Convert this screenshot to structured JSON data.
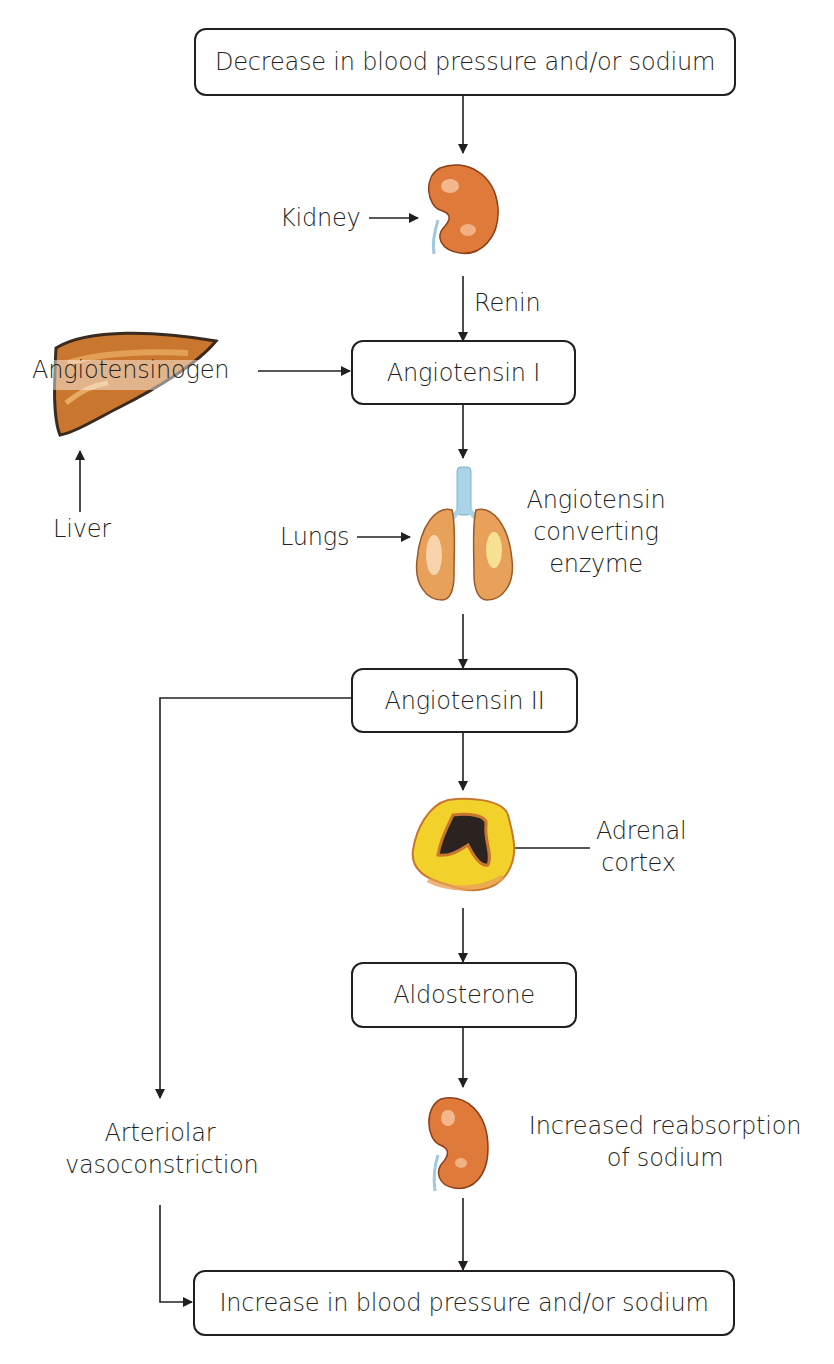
{
  "diagram": {
    "boxes": {
      "start": "Decrease in blood pressure and/or sodium",
      "angiotensin_1": "Angiotensin I",
      "angiotensin_2": "Angiotensin II",
      "aldosterone": "Aldosterone",
      "end": "Increase in blood pressure and/or sodium"
    },
    "labels": {
      "kidney": "Kidney",
      "renin": "Renin",
      "angiotensinogen": "Angiotensinogen",
      "liver": "Liver",
      "lungs": "Lungs",
      "ace_line1": "Angiotensin",
      "ace_line2": "converting",
      "ace_line3": "enzyme",
      "adrenal_line1": "Adrenal",
      "adrenal_line2": "cortex",
      "arteriolar_line1": "Arteriolar",
      "arteriolar_line2": "vasoconstriction",
      "reabsorption_line1": "Increased reabsorption",
      "reabsorption_line2": "of sodium"
    },
    "organs": [
      "kidney-icon",
      "liver-icon",
      "lungs-icon",
      "adrenal-gland-icon",
      "kidney-icon"
    ],
    "colors": {
      "line": "#231f20",
      "kidney": "#e07a3a",
      "liver": "#c9772e",
      "lungs": "#e8a15a",
      "trachea": "#a9d3e6",
      "adrenal_outer": "#f2d22a",
      "adrenal_inner": "#2a2320"
    }
  }
}
